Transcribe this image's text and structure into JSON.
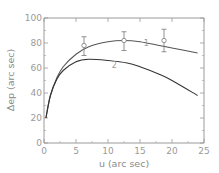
{
  "chart_data": {
    "type": "line",
    "title": "",
    "xlabel": "u (arc sec)",
    "ylabel": "Δep (arc sec)",
    "xlim": [
      0,
      25
    ],
    "ylim": [
      0,
      100
    ],
    "xticks": [
      0,
      5,
      10,
      15,
      20,
      25
    ],
    "yticks": [
      0,
      20,
      40,
      60,
      80,
      100
    ],
    "grid": false,
    "legend": "none (curves labeled inline '1' and '2')",
    "series": [
      {
        "name": "1",
        "x": [
          0.3,
          1,
          2,
          3,
          5,
          7,
          10,
          12.5,
          15,
          18,
          20,
          24
        ],
        "y": [
          20,
          38,
          52,
          61,
          71,
          77,
          81,
          82,
          81,
          78,
          76,
          72
        ],
        "label_pos": [
          16,
          78
        ]
      },
      {
        "name": "2",
        "x": [
          0.3,
          1,
          2,
          3,
          5,
          7,
          10,
          13,
          15,
          18,
          20,
          24
        ],
        "y": [
          20,
          38,
          51,
          58,
          65,
          67,
          66,
          64,
          61,
          55,
          50,
          38
        ],
        "label_pos": [
          11,
          60
        ]
      }
    ],
    "observations": {
      "name": "data points with error bars",
      "x": [
        6.25,
        12.5,
        18.75
      ],
      "y": [
        78,
        82,
        82
      ],
      "err_low": [
        70,
        74,
        73
      ],
      "err_high": [
        85,
        89,
        91
      ]
    }
  }
}
